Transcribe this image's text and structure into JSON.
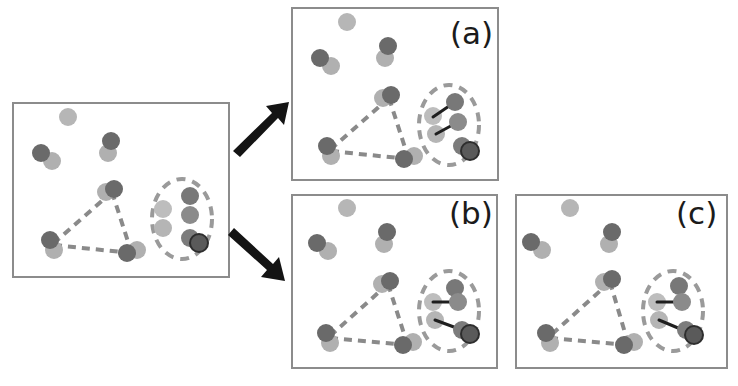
{
  "figure": {
    "width": 738,
    "height": 386,
    "background": "#ffffff"
  },
  "colors": {
    "panel_border": "#8c8c8c",
    "panel_fill": "#ffffff",
    "node_dark": "#5e5e5e",
    "node_mid": "#8f8f8f",
    "node_light": "#b6b6b6",
    "node_lighter": "#c8c8c8",
    "node_outline_dark": "#3a3a3a",
    "edge_dashed": "#8a8a8a",
    "edge_solid": "#1f1f1f",
    "ellipse_dashed": "#9a9a9a",
    "arrow": "#141414"
  },
  "style": {
    "node_radius": 9,
    "node_radius_small": 8,
    "panel_border_width": 2,
    "dashed_edge_width": 4,
    "solid_edge_width": 3,
    "ellipse_dash_width": 4
  },
  "panels": [
    {
      "id": "source",
      "label": "",
      "role": "input-graph",
      "rect": {
        "x": 13,
        "y": 103,
        "w": 216,
        "h": 174
      },
      "nodes": [
        {
          "name": "free-node-top",
          "x": 68,
          "y": 117,
          "fill": "#b6b6b6",
          "layer": "light"
        },
        {
          "name": "free-node-left-dark",
          "x": 41,
          "y": 153,
          "fill": "#6a6a6a",
          "layer": "dark"
        },
        {
          "name": "free-node-left-light",
          "x": 52,
          "y": 161,
          "fill": "#b0b0b0",
          "layer": "light"
        },
        {
          "name": "free-node-mid-dark",
          "x": 111,
          "y": 141,
          "fill": "#6a6a6a",
          "layer": "dark"
        },
        {
          "name": "free-node-mid-light",
          "x": 108,
          "y": 153,
          "fill": "#b0b0b0",
          "layer": "light"
        },
        {
          "name": "tri-node-top-light",
          "x": 106,
          "y": 192,
          "fill": "#b0b0b0",
          "layer": "light"
        },
        {
          "name": "tri-node-top-dark",
          "x": 114,
          "y": 189,
          "fill": "#6a6a6a",
          "layer": "dark"
        },
        {
          "name": "tri-node-left-dark",
          "x": 50,
          "y": 240,
          "fill": "#6a6a6a",
          "layer": "dark"
        },
        {
          "name": "tri-node-left-light",
          "x": 54,
          "y": 250,
          "fill": "#b0b0b0",
          "layer": "light"
        },
        {
          "name": "tri-node-right-dark",
          "x": 127,
          "y": 253,
          "fill": "#6a6a6a",
          "layer": "dark"
        },
        {
          "name": "tri-node-right-light",
          "x": 137,
          "y": 250,
          "fill": "#b0b0b0",
          "layer": "light"
        },
        {
          "name": "cluster-node-a",
          "x": 190,
          "y": 196,
          "fill": "#787878",
          "layer": "dark"
        },
        {
          "name": "cluster-node-b",
          "x": 163,
          "y": 209,
          "fill": "#bdbdbd",
          "layer": "light"
        },
        {
          "name": "cluster-node-c",
          "x": 190,
          "y": 215,
          "fill": "#8b8b8b",
          "layer": "dark"
        },
        {
          "name": "cluster-node-d",
          "x": 163,
          "y": 228,
          "fill": "#b5b5b5",
          "layer": "light"
        },
        {
          "name": "cluster-node-e",
          "x": 190,
          "y": 238,
          "fill": "#7c7c7c",
          "layer": "dark"
        },
        {
          "name": "cluster-node-f",
          "x": 199,
          "y": 243,
          "fill": "#5a5a5a",
          "layer": "dark",
          "outline": "#2e2e2e"
        }
      ],
      "dashed_edges": [
        {
          "x1": 112,
          "y1": 192,
          "x2": 54,
          "y2": 243
        },
        {
          "x1": 112,
          "y1": 192,
          "x2": 131,
          "y2": 251
        },
        {
          "x1": 54,
          "y1": 245,
          "x2": 131,
          "y2": 253
        }
      ],
      "solid_edges": [],
      "ellipse": {
        "cx": 182,
        "cy": 219,
        "rx": 30,
        "ry": 40
      }
    },
    {
      "id": "a",
      "label": "(a)",
      "label_pos": {
        "x": 450,
        "y": 18
      },
      "role": "hypothesis-a",
      "rect": {
        "x": 292,
        "y": 8,
        "w": 206,
        "h": 172
      },
      "nodes": [
        {
          "name": "free-node-top",
          "x": 347,
          "y": 22,
          "fill": "#b6b6b6",
          "layer": "light"
        },
        {
          "name": "free-node-left-dark",
          "x": 320,
          "y": 58,
          "fill": "#6a6a6a",
          "layer": "dark"
        },
        {
          "name": "free-node-left-light",
          "x": 331,
          "y": 66,
          "fill": "#b0b0b0",
          "layer": "light"
        },
        {
          "name": "free-node-mid-dark",
          "x": 388,
          "y": 46,
          "fill": "#6a6a6a",
          "layer": "dark"
        },
        {
          "name": "free-node-mid-light",
          "x": 385,
          "y": 58,
          "fill": "#b0b0b0",
          "layer": "light"
        },
        {
          "name": "tri-node-top-light",
          "x": 383,
          "y": 98,
          "fill": "#b0b0b0",
          "layer": "light"
        },
        {
          "name": "tri-node-top-dark",
          "x": 391,
          "y": 95,
          "fill": "#6a6a6a",
          "layer": "dark"
        },
        {
          "name": "tri-node-left-dark",
          "x": 327,
          "y": 146,
          "fill": "#6a6a6a",
          "layer": "dark"
        },
        {
          "name": "tri-node-left-light",
          "x": 331,
          "y": 156,
          "fill": "#b0b0b0",
          "layer": "light"
        },
        {
          "name": "tri-node-right-dark",
          "x": 404,
          "y": 159,
          "fill": "#6a6a6a",
          "layer": "dark"
        },
        {
          "name": "tri-node-right-light",
          "x": 414,
          "y": 156,
          "fill": "#b0b0b0",
          "layer": "light"
        },
        {
          "name": "cluster-node-a",
          "x": 455,
          "y": 102,
          "fill": "#787878",
          "layer": "dark"
        },
        {
          "name": "cluster-node-b",
          "x": 433,
          "y": 116,
          "fill": "#bdbdbd",
          "layer": "light"
        },
        {
          "name": "cluster-node-c",
          "x": 458,
          "y": 122,
          "fill": "#8b8b8b",
          "layer": "dark"
        },
        {
          "name": "cluster-node-d",
          "x": 436,
          "y": 134,
          "fill": "#b5b5b5",
          "layer": "light"
        },
        {
          "name": "cluster-node-e",
          "x": 462,
          "y": 146,
          "fill": "#7c7c7c",
          "layer": "dark"
        },
        {
          "name": "cluster-node-f",
          "x": 470,
          "y": 151,
          "fill": "#5a5a5a",
          "layer": "dark",
          "outline": "#2e2e2e"
        }
      ],
      "dashed_edges": [
        {
          "x1": 389,
          "y1": 98,
          "x2": 331,
          "y2": 149
        },
        {
          "x1": 389,
          "y1": 98,
          "x2": 408,
          "y2": 157
        },
        {
          "x1": 331,
          "y1": 151,
          "x2": 408,
          "y2": 159
        }
      ],
      "solid_edges": [
        {
          "x1": 433,
          "y1": 117,
          "x2": 455,
          "y2": 102,
          "from": "cluster-node-b",
          "to": "cluster-node-a"
        },
        {
          "x1": 436,
          "y1": 134,
          "x2": 458,
          "y2": 122,
          "from": "cluster-node-d",
          "to": "cluster-node-c"
        }
      ],
      "ellipse": {
        "cx": 449,
        "cy": 125,
        "rx": 30,
        "ry": 40
      }
    },
    {
      "id": "b",
      "label": "(b)",
      "label_pos": {
        "x": 449,
        "y": 198
      },
      "role": "hypothesis-b",
      "rect": {
        "x": 292,
        "y": 195,
        "w": 205,
        "h": 173
      },
      "nodes": [
        {
          "name": "free-node-top",
          "x": 347,
          "y": 208,
          "fill": "#b6b6b6",
          "layer": "light"
        },
        {
          "name": "free-node-left-dark",
          "x": 317,
          "y": 243,
          "fill": "#6a6a6a",
          "layer": "dark"
        },
        {
          "name": "free-node-left-light",
          "x": 328,
          "y": 251,
          "fill": "#b0b0b0",
          "layer": "light"
        },
        {
          "name": "free-node-mid-dark",
          "x": 387,
          "y": 232,
          "fill": "#6a6a6a",
          "layer": "dark"
        },
        {
          "name": "free-node-mid-light",
          "x": 384,
          "y": 244,
          "fill": "#b0b0b0",
          "layer": "light"
        },
        {
          "name": "tri-node-top-light",
          "x": 382,
          "y": 284,
          "fill": "#b0b0b0",
          "layer": "light"
        },
        {
          "name": "tri-node-top-dark",
          "x": 390,
          "y": 281,
          "fill": "#6a6a6a",
          "layer": "dark"
        },
        {
          "name": "tri-node-left-dark",
          "x": 326,
          "y": 333,
          "fill": "#6a6a6a",
          "layer": "dark"
        },
        {
          "name": "tri-node-left-light",
          "x": 330,
          "y": 343,
          "fill": "#b0b0b0",
          "layer": "light"
        },
        {
          "name": "tri-node-right-dark",
          "x": 403,
          "y": 345,
          "fill": "#6a6a6a",
          "layer": "dark"
        },
        {
          "name": "tri-node-right-light",
          "x": 413,
          "y": 342,
          "fill": "#b0b0b0",
          "layer": "light"
        },
        {
          "name": "cluster-node-a",
          "x": 455,
          "y": 288,
          "fill": "#787878",
          "layer": "dark"
        },
        {
          "name": "cluster-node-b",
          "x": 433,
          "y": 302,
          "fill": "#bdbdbd",
          "layer": "light"
        },
        {
          "name": "cluster-node-c",
          "x": 458,
          "y": 302,
          "fill": "#8b8b8b",
          "layer": "dark"
        },
        {
          "name": "cluster-node-d",
          "x": 435,
          "y": 320,
          "fill": "#b5b5b5",
          "layer": "light"
        },
        {
          "name": "cluster-node-e",
          "x": 462,
          "y": 330,
          "fill": "#7c7c7c",
          "layer": "dark"
        },
        {
          "name": "cluster-node-f",
          "x": 470,
          "y": 334,
          "fill": "#5a5a5a",
          "layer": "dark",
          "outline": "#2e2e2e"
        }
      ],
      "dashed_edges": [
        {
          "x1": 388,
          "y1": 284,
          "x2": 330,
          "y2": 336
        },
        {
          "x1": 388,
          "y1": 284,
          "x2": 407,
          "y2": 343
        },
        {
          "x1": 330,
          "y1": 338,
          "x2": 407,
          "y2": 345
        }
      ],
      "solid_edges": [
        {
          "x1": 433,
          "y1": 302,
          "x2": 458,
          "y2": 302,
          "from": "cluster-node-b",
          "to": "cluster-node-c"
        },
        {
          "x1": 435,
          "y1": 320,
          "x2": 462,
          "y2": 330,
          "from": "cluster-node-d",
          "to": "cluster-node-e"
        }
      ],
      "ellipse": {
        "cx": 449,
        "cy": 311,
        "rx": 30,
        "ry": 40
      }
    },
    {
      "id": "c",
      "label": "(c)",
      "label_pos": {
        "x": 676,
        "y": 198
      },
      "role": "hypothesis-c",
      "rect": {
        "x": 516,
        "y": 195,
        "w": 211,
        "h": 173
      },
      "nodes": [
        {
          "name": "free-node-top",
          "x": 570,
          "y": 208,
          "fill": "#b6b6b6",
          "layer": "light"
        },
        {
          "name": "free-node-left-dark",
          "x": 531,
          "y": 242,
          "fill": "#6a6a6a",
          "layer": "dark"
        },
        {
          "name": "free-node-left-light",
          "x": 542,
          "y": 250,
          "fill": "#b0b0b0",
          "layer": "light"
        },
        {
          "name": "free-node-mid-dark",
          "x": 612,
          "y": 232,
          "fill": "#6a6a6a",
          "layer": "dark"
        },
        {
          "name": "free-node-mid-light",
          "x": 609,
          "y": 244,
          "fill": "#b0b0b0",
          "layer": "light"
        },
        {
          "name": "tri-node-top-light",
          "x": 604,
          "y": 282,
          "fill": "#b0b0b0",
          "layer": "light"
        },
        {
          "name": "tri-node-top-dark",
          "x": 612,
          "y": 279,
          "fill": "#6a6a6a",
          "layer": "dark"
        },
        {
          "name": "tri-node-left-dark",
          "x": 546,
          "y": 333,
          "fill": "#6a6a6a",
          "layer": "dark"
        },
        {
          "name": "tri-node-left-light",
          "x": 550,
          "y": 343,
          "fill": "#b0b0b0",
          "layer": "light"
        },
        {
          "name": "tri-node-right-dark",
          "x": 624,
          "y": 345,
          "fill": "#6a6a6a",
          "layer": "dark"
        },
        {
          "name": "tri-node-right-light",
          "x": 634,
          "y": 342,
          "fill": "#b0b0b0",
          "layer": "light"
        },
        {
          "name": "cluster-node-a",
          "x": 679,
          "y": 286,
          "fill": "#787878",
          "layer": "dark"
        },
        {
          "name": "cluster-node-b",
          "x": 657,
          "y": 302,
          "fill": "#bdbdbd",
          "layer": "light"
        },
        {
          "name": "cluster-node-c",
          "x": 682,
          "y": 302,
          "fill": "#8b8b8b",
          "layer": "dark"
        },
        {
          "name": "cluster-node-d",
          "x": 659,
          "y": 320,
          "fill": "#b5b5b5",
          "layer": "light"
        },
        {
          "name": "cluster-node-e",
          "x": 686,
          "y": 330,
          "fill": "#7c7c7c",
          "layer": "dark"
        },
        {
          "name": "cluster-node-f",
          "x": 694,
          "y": 335,
          "fill": "#5a5a5a",
          "layer": "dark",
          "outline": "#2e2e2e"
        }
      ],
      "dashed_edges": [
        {
          "x1": 610,
          "y1": 282,
          "x2": 550,
          "y2": 336
        },
        {
          "x1": 610,
          "y1": 282,
          "x2": 628,
          "y2": 343
        },
        {
          "x1": 550,
          "y1": 338,
          "x2": 628,
          "y2": 345
        }
      ],
      "solid_edges": [
        {
          "x1": 657,
          "y1": 302,
          "x2": 682,
          "y2": 302,
          "from": "cluster-node-b",
          "to": "cluster-node-c"
        },
        {
          "x1": 659,
          "y1": 320,
          "x2": 690,
          "y2": 333,
          "from": "cluster-node-d",
          "to": "cluster-node-e"
        }
      ],
      "ellipse": {
        "cx": 673,
        "cy": 311,
        "rx": 30,
        "ry": 40
      }
    }
  ],
  "arrows": [
    {
      "name": "arrow-to-panel-a",
      "direction": "up-right",
      "points": "233,151 272,113 266,106 289,102 284,125 278,118 240,157",
      "fill": "#141414"
    },
    {
      "name": "arrow-to-panel-b",
      "direction": "down-right",
      "points": "234,228 273,264 279,257 285,281 261,277 267,270 228,235",
      "fill": "#141414"
    }
  ]
}
